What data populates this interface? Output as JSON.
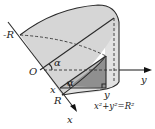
{
  "figure": {
    "type": "solid-of-cross-sections",
    "labels": {
      "neg_R": "-R",
      "origin": "O",
      "R": "R",
      "x_axis": "x",
      "y_axis": "y",
      "x_point": "x",
      "y_point": "y",
      "alpha_top": "α",
      "alpha_bottom": "α",
      "equation_lhs": "x",
      "equation": "x²+y²=R²"
    },
    "colors": {
      "solid_face": "#d6d6d6",
      "cylinder_side": "#e2e2e2",
      "cross_section": "#8f8f8f",
      "cross_section_light": "#bdbdbd",
      "edge": "#2a2a2a",
      "background": "#ffffff"
    }
  }
}
